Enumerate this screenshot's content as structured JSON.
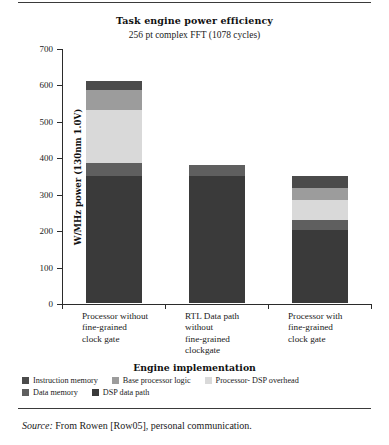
{
  "figure": {
    "title": "Task engine power efficiency",
    "subtitle": "256 pt complex  FFT (1078 cycles)",
    "source_prefix": "Source:",
    "source_text": "From Rowen [Row05], personal communication."
  },
  "chart_data": {
    "type": "bar",
    "stacked": true,
    "title": "Task engine power efficiency",
    "subtitle": "256 pt complex  FFT (1078 cycles)",
    "xlabel": "Engine implementation",
    "ylabel": "W/MHz power (130nm 1.0V)",
    "ylim": [
      0,
      700
    ],
    "yticks": [
      0,
      100,
      200,
      300,
      400,
      500,
      600,
      700
    ],
    "ytick_labels": [
      "0",
      "100",
      "200",
      "300",
      "400",
      "500",
      "600",
      "700"
    ],
    "grid": false,
    "legend_position": "below",
    "categories": [
      "Processor without fine-grained clock gate",
      "RTL Data path without fine-grained clockgate",
      "Processor with fine-grained clock gate"
    ],
    "category_lines": [
      [
        "Processor without",
        "fine-grained",
        "clock gate"
      ],
      [
        "RTL Data path",
        "without",
        "fine-grained",
        "clockgate"
      ],
      [
        "Processor with",
        "fine-grained",
        "clock gate"
      ]
    ],
    "series": [
      {
        "name": "DSP data path",
        "color": "#3a3a3a",
        "values": [
          350,
          350,
          200
        ]
      },
      {
        "name": "Data memory",
        "color": "#5f5f5f",
        "values": [
          35,
          30,
          27
        ]
      },
      {
        "name": "Processor- DSP overhead",
        "color": "#d9d9d9",
        "values": [
          145,
          0,
          55
        ]
      },
      {
        "name": "Base processor logic",
        "color": "#9c9c9c",
        "values": [
          55,
          0,
          33
        ]
      },
      {
        "name": "Instruction memory",
        "color": "#4b4b4b",
        "values": [
          25,
          0,
          35
        ]
      }
    ],
    "totals": [
      610,
      380,
      350
    ]
  },
  "legend": {
    "rows": [
      [
        {
          "label": "Instruction memory",
          "color": "#4b4b4b"
        },
        {
          "label": "Base processor logic",
          "color": "#9c9c9c"
        },
        {
          "label": "Processor- DSP overhead",
          "color": "#d9d9d9"
        }
      ],
      [
        {
          "label": "Data memory",
          "color": "#5f5f5f"
        },
        {
          "label": "DSP data path",
          "color": "#3a3a3a"
        }
      ]
    ]
  }
}
